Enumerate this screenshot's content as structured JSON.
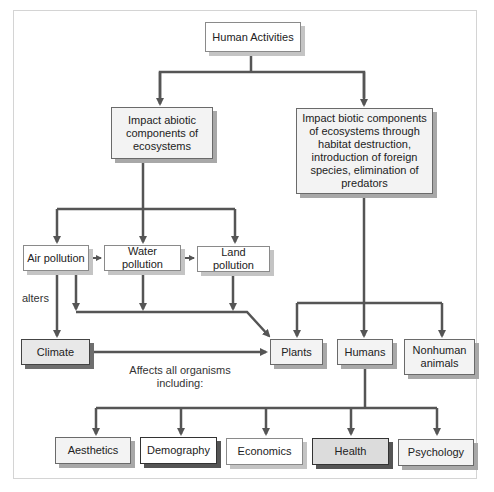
{
  "diagram": {
    "root": "Human Activities",
    "abiotic": "Impact abiotic components of ecosystems",
    "biotic": "Impact biotic components of ecosystems through habitat destruction, introduction of foreign species, elimination of predators",
    "pollution": [
      "Air pollution",
      "Water pollution",
      "Land pollution"
    ],
    "climate": "Climate",
    "alters_label": "alters",
    "affects_label": "Affects all organisms including:",
    "organisms": [
      "Plants",
      "Humans",
      "Nonhuman animals"
    ],
    "human_impacts": [
      "Aesthetics",
      "Demography",
      "Economics",
      "Health",
      "Psychology"
    ]
  },
  "colors": {
    "line": "#555555",
    "border": "#6a6a6a",
    "shadow": "#9a9a9a"
  }
}
